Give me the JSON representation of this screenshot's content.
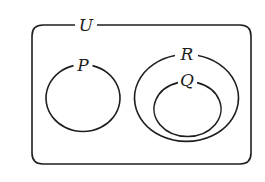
{
  "diagram": {
    "type": "venn",
    "universal_set": {
      "label": "U"
    },
    "sets": [
      {
        "id": "P",
        "label": "P"
      },
      {
        "id": "R",
        "label": "R"
      },
      {
        "id": "Q",
        "label": "Q"
      }
    ],
    "relationships": [
      "Q is a subset of R",
      "P is disjoint from R",
      "P is disjoint from Q"
    ],
    "colors": {
      "stroke": "#1e1e1e",
      "background": "#ffffff"
    }
  }
}
